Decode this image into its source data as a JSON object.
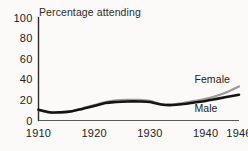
{
  "chart_data": {
    "type": "line",
    "title": "Percentage attending",
    "xlabel": "",
    "ylabel": "",
    "xlim": [
      1910,
      1946
    ],
    "ylim": [
      0,
      100
    ],
    "grid": false,
    "legend_position": "inline-right",
    "x_ticks": [
      "1910",
      "1920",
      "1930",
      "1940",
      "1946"
    ],
    "x_tick_values": [
      1910,
      1920,
      1930,
      1940,
      1946
    ],
    "y_ticks": [
      "0",
      "20",
      "40",
      "60",
      "80",
      "100"
    ],
    "y_tick_values": [
      0,
      20,
      40,
      60,
      80,
      100
    ],
    "x": [
      1910,
      1912,
      1914,
      1916,
      1918,
      1920,
      1922,
      1924,
      1926,
      1928,
      1930,
      1932,
      1934,
      1936,
      1938,
      1940,
      1942,
      1944,
      1946
    ],
    "series": [
      {
        "name": "Female",
        "color": "#9a9a9a",
        "values": [
          10,
          7.5,
          7.5,
          9,
          12,
          15,
          18,
          19.5,
          20,
          20,
          19,
          16,
          15.5,
          17,
          19,
          21,
          24,
          28,
          33
        ]
      },
      {
        "name": "Male",
        "color": "#141414",
        "values": [
          10.5,
          8,
          8,
          9,
          11.5,
          14,
          17,
          18,
          18.5,
          18.5,
          18,
          15.5,
          15,
          16,
          17.5,
          19,
          21,
          23,
          25
        ]
      }
    ],
    "annotations": [
      {
        "text": "Female",
        "series": "Female",
        "x": 1938,
        "y": 36
      },
      {
        "text": "Male",
        "series": "Male",
        "x": 1938,
        "y": 8
      }
    ]
  }
}
